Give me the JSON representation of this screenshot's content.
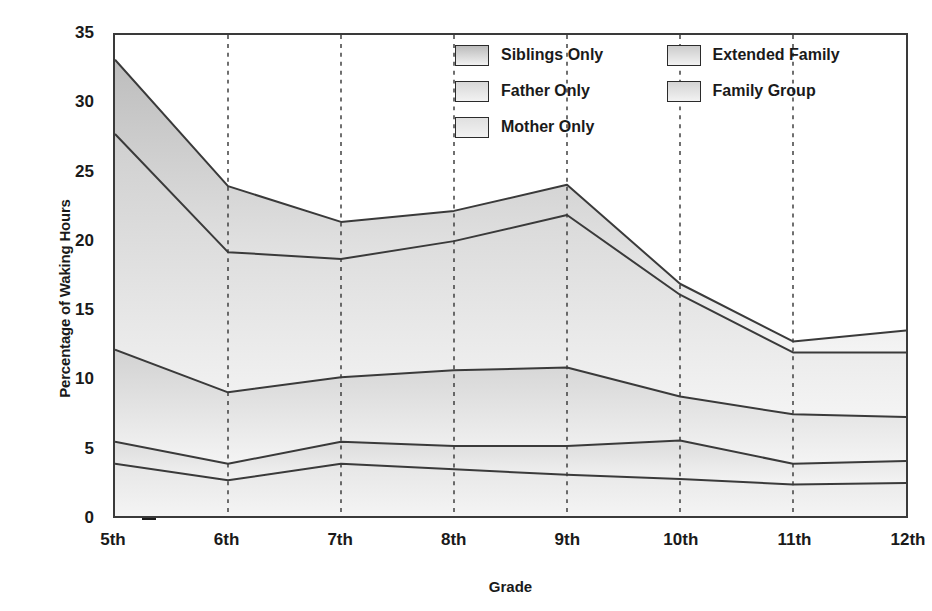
{
  "chart_data": {
    "type": "area",
    "stacked": true,
    "title": "",
    "xlabel": "Grade",
    "ylabel": "Percentage of Waking Hours",
    "categories": [
      "5th",
      "6th",
      "7th",
      "8th",
      "9th",
      "10th",
      "11th",
      "12th"
    ],
    "ylim": [
      0,
      35
    ],
    "yticks": [
      0,
      5,
      10,
      15,
      20,
      25,
      30,
      35
    ],
    "grid": "vertical-dotted",
    "legend_position": "top-right-inside",
    "series": [
      {
        "name": "Mother Only",
        "values": [
          3.8,
          2.6,
          3.8,
          3.4,
          3.0,
          2.7,
          2.3,
          2.4
        ],
        "color": "#e6e6e6"
      },
      {
        "name": "Father Only",
        "values": [
          1.6,
          1.2,
          1.6,
          1.7,
          2.1,
          2.8,
          1.5,
          1.6
        ],
        "color": "#dcdcdc"
      },
      {
        "name": "Family Group",
        "values": [
          6.7,
          5.2,
          4.7,
          5.5,
          5.7,
          3.2,
          3.6,
          3.2
        ],
        "color": "#d2d2d2"
      },
      {
        "name": "Siblings Only",
        "values": [
          15.7,
          10.2,
          8.6,
          9.4,
          11.1,
          7.4,
          4.5,
          4.7
        ],
        "color": "#cfcfcf"
      },
      {
        "name": "Extended Family",
        "values": [
          5.4,
          4.8,
          2.7,
          2.2,
          2.2,
          0.8,
          0.8,
          1.6
        ],
        "color": "#bdbdbd"
      }
    ],
    "cumulative": {
      "Mother Only": [
        3.8,
        2.6,
        3.8,
        3.4,
        3.0,
        2.7,
        2.3,
        2.4
      ],
      "Father Only": [
        5.4,
        3.8,
        5.4,
        5.1,
        5.1,
        5.5,
        3.8,
        4.0
      ],
      "Family Group": [
        12.1,
        9.0,
        10.1,
        10.6,
        10.8,
        8.7,
        7.4,
        7.2
      ],
      "Siblings Only": [
        27.8,
        19.2,
        18.7,
        20.0,
        21.9,
        16.1,
        11.9,
        11.9
      ],
      "Extended Family": [
        33.2,
        24.0,
        21.4,
        22.2,
        24.1,
        16.9,
        12.7,
        13.5
      ]
    }
  },
  "legend": {
    "column_left": [
      {
        "label": "Siblings Only",
        "color": "#bcbcbc"
      },
      {
        "label": "Father Only",
        "color": "#d8d8d8"
      },
      {
        "label": "Mother Only",
        "color": "#e0e0e0"
      }
    ],
    "column_right": [
      {
        "label": "Extended Family",
        "color": "#cccccc"
      },
      {
        "label": "Family Group",
        "color": "#d4d4d4"
      }
    ]
  },
  "axes": {
    "y_title": "Percentage of Waking Hours",
    "x_title": "Grade",
    "y_tick_labels": [
      "35",
      "30",
      "25",
      "20",
      "15",
      "10",
      "5",
      "0"
    ],
    "x_tick_labels": [
      "5th",
      "6th",
      "7th",
      "8th",
      "9th",
      "10th",
      "11th",
      "12th"
    ]
  }
}
